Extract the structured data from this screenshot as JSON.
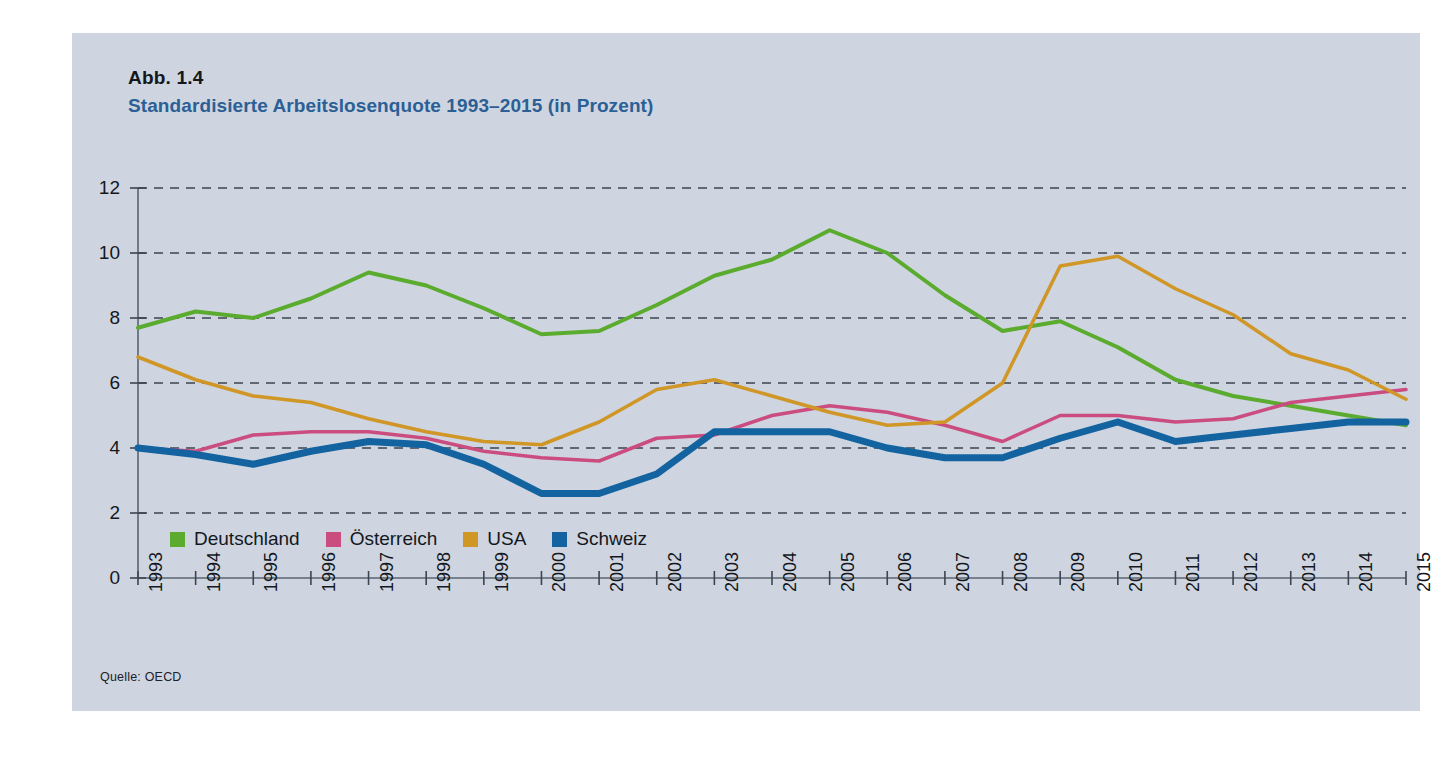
{
  "figure": {
    "label": "Abb. 1.4",
    "title": "Standardisierte Arbeitslosenquote 1993–2015 (in Prozent)",
    "source": "Quelle: OECD",
    "panel_bg": "#ced5e0",
    "title_color": "#2b5f95"
  },
  "chart_data": {
    "type": "line",
    "title": "Standardisierte Arbeitslosenquote 1993–2015 (in Prozent)",
    "xlabel": "",
    "ylabel": "",
    "ylim": [
      0,
      12
    ],
    "yticks": [
      0,
      2,
      4,
      6,
      8,
      10,
      12
    ],
    "ytick_labels": [
      "0",
      "2",
      "4",
      "6",
      "8",
      "10",
      "12"
    ],
    "grid": "horizontal-dashed",
    "legend_position": "inside-bottom-left",
    "x": [
      1993,
      1994,
      1995,
      1996,
      1997,
      1998,
      1999,
      2000,
      2001,
      2002,
      2003,
      2004,
      2005,
      2006,
      2007,
      2008,
      2009,
      2010,
      2011,
      2012,
      2013,
      2014,
      2015
    ],
    "xtick_labels": [
      "1993",
      "1994",
      "1995",
      "1996",
      "1997",
      "1998",
      "1999",
      "2000",
      "2001",
      "2002",
      "2003",
      "2004",
      "2005",
      "2006",
      "2007",
      "2008",
      "2009",
      "2010",
      "2011",
      "2012",
      "2013",
      "2014",
      "2015"
    ],
    "series": [
      {
        "name": "Deutschland",
        "color": "#5aab2e",
        "width": 4,
        "values": [
          7.7,
          8.2,
          8.0,
          8.6,
          9.4,
          9.0,
          8.3,
          7.5,
          7.6,
          8.4,
          9.3,
          9.8,
          10.7,
          10.0,
          8.7,
          7.6,
          7.9,
          7.1,
          6.1,
          5.6,
          5.3,
          5.0,
          4.7
        ]
      },
      {
        "name": "Österreich",
        "color": "#cb4d80",
        "width": 3.5,
        "values": [
          4.0,
          3.9,
          4.4,
          4.5,
          4.5,
          4.3,
          3.9,
          3.7,
          3.6,
          4.3,
          4.4,
          5.0,
          5.3,
          5.1,
          4.7,
          4.2,
          5.0,
          5.0,
          4.8,
          4.9,
          5.4,
          5.6,
          5.8
        ]
      },
      {
        "name": "USA",
        "color": "#d09626",
        "width": 3.5,
        "values": [
          6.8,
          6.1,
          5.6,
          5.4,
          4.9,
          4.5,
          4.2,
          4.1,
          4.8,
          5.8,
          6.1,
          5.6,
          5.1,
          4.7,
          4.8,
          6.0,
          9.6,
          9.9,
          8.9,
          8.1,
          6.9,
          6.4,
          5.5
        ]
      },
      {
        "name": "Schweiz",
        "color": "#12639f",
        "width": 7,
        "values": [
          4.0,
          3.8,
          3.5,
          3.9,
          4.2,
          4.1,
          3.5,
          2.6,
          2.6,
          3.2,
          4.5,
          4.5,
          4.5,
          4.0,
          3.7,
          3.7,
          4.3,
          4.8,
          4.2,
          4.4,
          4.6,
          4.8,
          4.8
        ]
      }
    ]
  },
  "legend": {
    "items": [
      {
        "label": "Deutschland",
        "color": "#5aab2e"
      },
      {
        "label": "Österreich",
        "color": "#cb4d80"
      },
      {
        "label": "USA",
        "color": "#d09626"
      },
      {
        "label": "Schweiz",
        "color": "#12639f"
      }
    ]
  }
}
